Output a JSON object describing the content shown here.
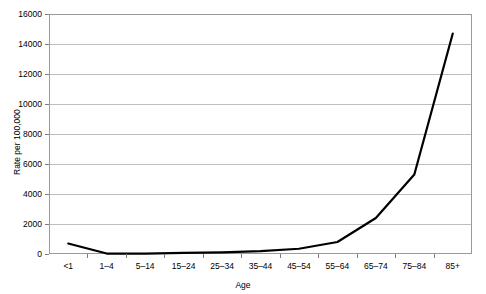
{
  "chart_data": {
    "type": "line",
    "title": "",
    "xlabel": "Age",
    "ylabel": "Rate per 100,000",
    "categories": [
      "<1",
      "1–4",
      "5–14",
      "15–24",
      "25–34",
      "35–44",
      "45–54",
      "55–64",
      "65–74",
      "75–84",
      "85+"
    ],
    "series": [
      {
        "name": "Rate",
        "color": "#000000",
        "values": [
          700,
          30,
          25,
          80,
          110,
          190,
          350,
          800,
          2400,
          5300,
          14700
        ]
      }
    ],
    "ylim": [
      0,
      16000
    ],
    "ytick_labels": [
      "0",
      "2000",
      "4000",
      "6000",
      "8000",
      "10000",
      "12000",
      "14000",
      "16000"
    ],
    "ytick_values": [
      0,
      2000,
      4000,
      6000,
      8000,
      10000,
      12000,
      14000,
      16000
    ],
    "grid": "horizontal",
    "legend": "none",
    "grid_color": "#bdbdbd",
    "frame_color": "#9a9a9a"
  }
}
